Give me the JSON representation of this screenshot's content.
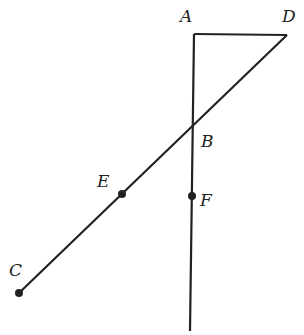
{
  "diagram": {
    "type": "geometry",
    "points": {
      "A": {
        "label": "A",
        "x": 194,
        "y": 34
      },
      "B": {
        "label": "B",
        "x": 192,
        "y": 127
      },
      "C": {
        "label": "C",
        "x": 19,
        "y": 293
      },
      "D": {
        "label": "D",
        "x": 287,
        "y": 35
      },
      "E": {
        "label": "E",
        "x": 122,
        "y": 194
      },
      "F": {
        "label": "F",
        "x": 192,
        "y": 196
      }
    },
    "segments": [
      {
        "from": "A",
        "to": "D"
      },
      {
        "from": "A",
        "to": "F",
        "extends_below": true
      },
      {
        "from": "C",
        "to": "D",
        "through": [
          "E",
          "B"
        ]
      }
    ],
    "dots": [
      "C",
      "E",
      "F"
    ],
    "line_color": "#222222"
  }
}
